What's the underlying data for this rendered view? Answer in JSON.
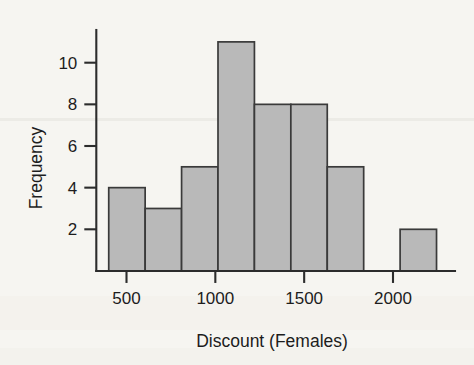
{
  "chart_data": {
    "type": "bar",
    "chart_subtype": "histogram",
    "title": "",
    "xlabel": "Discount (Females)",
    "ylabel": "Frequency",
    "xlim": [
      330,
      2300
    ],
    "ylim": [
      0,
      11.6
    ],
    "grid": false,
    "legend": null,
    "bar_fill_color": "#b9b9b9",
    "bar_edge_color": "#3a3a3a",
    "background_color": "#f6f5f1",
    "axis_color": "#2c2c2c",
    "x_ticks": [
      500,
      1000,
      1500,
      2000
    ],
    "x_tick_labels": [
      "500",
      "1000",
      "1500",
      "2000"
    ],
    "y_ticks": [
      2,
      4,
      6,
      8,
      10
    ],
    "y_tick_labels": [
      "2",
      "4",
      "6",
      "8",
      "10"
    ],
    "bin_width": 205,
    "bin_edges": [
      400,
      605,
      810,
      1015,
      1220,
      1425,
      1630,
      1835,
      2040,
      2245
    ],
    "bin_centers": [
      502.5,
      707.5,
      912.5,
      1117.5,
      1322.5,
      1527.5,
      1732.5,
      1937.5,
      2142.5
    ],
    "values": [
      4,
      3,
      5,
      11,
      8,
      8,
      5,
      0,
      2
    ],
    "categories": [
      "400-605",
      "605-810",
      "810-1015",
      "1015-1220",
      "1220-1425",
      "1425-1630",
      "1630-1835",
      "1835-2040",
      "2040-2245"
    ],
    "total_count": 46
  }
}
